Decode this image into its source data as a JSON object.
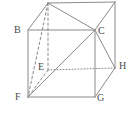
{
  "figure": {
    "name": "cube-diagram",
    "type": "geometry-solid",
    "shape": "cube",
    "canvas": {
      "width": 136,
      "height": 120
    },
    "stroke_color": "#8a8a8a",
    "label_color": "#4a4a4a",
    "background_color": "#ffffff",
    "labels": [
      {
        "id": "B",
        "text": "B",
        "x": 14,
        "y": 25
      },
      {
        "id": "C",
        "text": "C",
        "x": 98,
        "y": 26
      },
      {
        "id": "E",
        "text": "E",
        "x": 38,
        "y": 62
      },
      {
        "id": "H",
        "text": "H",
        "x": 119,
        "y": 61
      },
      {
        "id": "F",
        "text": "F",
        "x": 15,
        "y": 92
      },
      {
        "id": "G",
        "text": "G",
        "x": 97,
        "y": 93
      }
    ],
    "vertices": {
      "A": {
        "x": 48,
        "y": 3
      },
      "B": {
        "x": 28,
        "y": 30
      },
      "C": {
        "x": 95,
        "y": 30
      },
      "D": {
        "x": 115,
        "y": 2
      },
      "E": {
        "x": 48,
        "y": 70
      },
      "F": {
        "x": 28,
        "y": 97
      },
      "G": {
        "x": 95,
        "y": 97
      },
      "H": {
        "x": 115,
        "y": 68
      }
    },
    "edges_solid": [
      {
        "name": "edge-B-C",
        "from": "B",
        "to": "C"
      },
      {
        "name": "edge-B-F",
        "from": "B",
        "to": "F"
      },
      {
        "name": "edge-F-G",
        "from": "F",
        "to": "G"
      },
      {
        "name": "edge-C-G",
        "from": "C",
        "to": "G"
      },
      {
        "name": "edge-A-B",
        "from": "A",
        "to": "B"
      },
      {
        "name": "edge-A-D",
        "from": "A",
        "to": "D"
      },
      {
        "name": "edge-C-D",
        "from": "C",
        "to": "D"
      },
      {
        "name": "edge-D-H",
        "from": "D",
        "to": "H"
      },
      {
        "name": "edge-C-H",
        "from": "C",
        "to": "H"
      },
      {
        "name": "edge-G-H",
        "from": "G",
        "to": "H"
      }
    ],
    "diagonals_solid": [
      {
        "name": "diagonal-A-C",
        "from": "A",
        "to": "C"
      },
      {
        "name": "diagonal-F-C",
        "from": "F",
        "to": "C"
      }
    ],
    "edges_hidden_dashed": [
      {
        "name": "hidden-edge-A-E",
        "from": "A",
        "to": "E"
      },
      {
        "name": "hidden-edge-E-F",
        "from": "E",
        "to": "F"
      }
    ],
    "diagonals_hidden_dashed": [
      {
        "name": "hidden-diagonal-A-F",
        "from": "A",
        "to": "F"
      }
    ],
    "edges_hidden_dotted": [
      {
        "name": "hidden-edge-E-H",
        "from": "E",
        "to": "H"
      }
    ]
  }
}
